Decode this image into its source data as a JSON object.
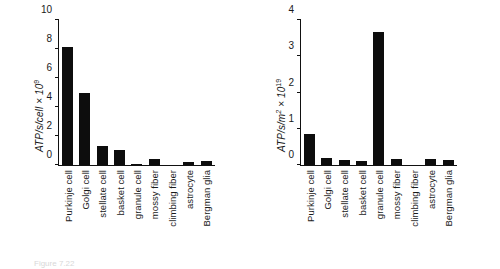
{
  "chart_data": [
    {
      "type": "bar",
      "panel": "left",
      "title": "",
      "xlabel": "",
      "ylabel": "ATP/s/cell × 10",
      "ylabel_exponent": "9",
      "ylim": [
        0,
        10
      ],
      "yticks": [
        "0",
        "2",
        "4",
        "6",
        "8",
        "10"
      ],
      "ytick_values": [
        0,
        2,
        4,
        6,
        8,
        10
      ],
      "grid": false,
      "legend": "none",
      "categories": [
        "Purkinje cell",
        "Golgi cell",
        "stellate cell",
        "basket cell",
        "granule cell",
        "mossy fiber",
        "climbing fiber",
        "astrocyte",
        "Bergman glia"
      ],
      "values": [
        8.15,
        4.95,
        1.3,
        1.05,
        0.1,
        0.4,
        0.0,
        0.22,
        0.28
      ],
      "bar_color": "#0d0d0d"
    },
    {
      "type": "bar",
      "panel": "right",
      "title": "",
      "xlabel": "",
      "ylabel": "ATP/s/m",
      "ylabel_unit_exponent": "2",
      "ylabel_tail": " × 10",
      "ylabel_exponent": "19",
      "ylim": [
        0,
        4
      ],
      "yticks": [
        "0",
        "1",
        "2",
        "3",
        "4"
      ],
      "ytick_values": [
        0,
        1,
        2,
        3,
        4
      ],
      "grid": false,
      "legend": "none",
      "categories": [
        "Purkinje cell",
        "Golgi cell",
        "stellate cell",
        "basket cell",
        "granule cell",
        "mossy fiber",
        "climbing fiber",
        "astrocyte",
        "Bergman glia"
      ],
      "values": [
        0.85,
        0.2,
        0.15,
        0.12,
        3.68,
        0.16,
        0.0,
        0.17,
        0.14
      ],
      "bar_color": "#0d0d0d"
    }
  ],
  "caption": {
    "text": "Figure 7.22"
  }
}
